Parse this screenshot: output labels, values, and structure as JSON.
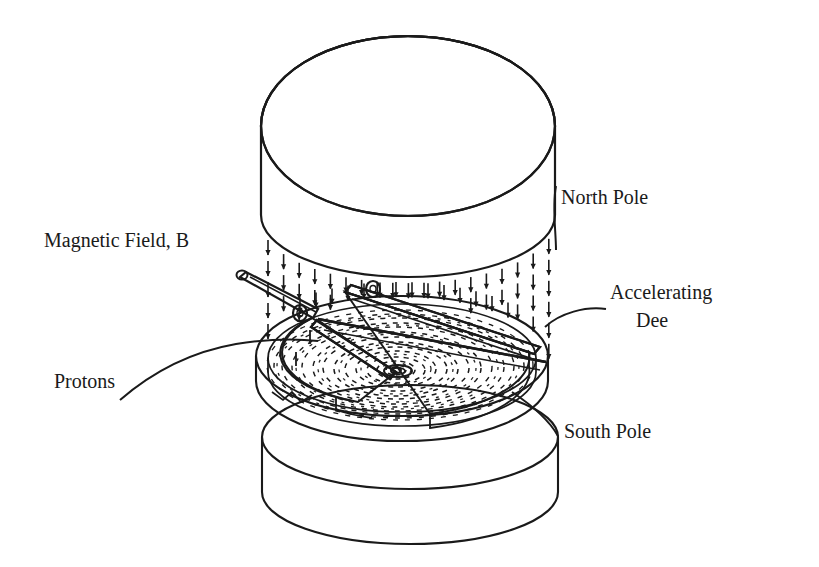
{
  "figure": {
    "kind": "technical-line-diagram",
    "background_color": "#ffffff",
    "ink_color": "#1a1a1a",
    "width": 819,
    "height": 567
  },
  "labels": {
    "north_pole": "North Pole",
    "south_pole": "South Pole",
    "magnetic_field": "Magnetic Field, B",
    "accelerating_dee_line1": "Accelerating",
    "accelerating_dee_line2": "Dee",
    "protons": "Protons"
  },
  "parts": {
    "north_pole_magnet": "North Pole",
    "south_pole_magnet": "South Pole",
    "dee_left": "Accelerating Dee",
    "dee_right": "Accelerating Dee",
    "proton_spiral": "Protons",
    "field_arrows": "Magnetic Field, B",
    "rf_stem": "RF feed stem",
    "gap_connector_lower": "insulator bushing",
    "gap_connector_upper": "insulator bushing"
  },
  "field": {
    "direction": "downward",
    "arrow_glyph": "down-arrow",
    "arrow_count": 96
  },
  "geometry": {
    "north_pole": {
      "cx": 408,
      "cy": 126,
      "rx": 147,
      "ry": 90,
      "height": 92
    },
    "south_pole": {
      "cx": 410,
      "cy": 440,
      "rx": 148,
      "ry": 52,
      "height": 96
    },
    "dee_assembly": {
      "cx": 398,
      "cy": 365,
      "rx": 140,
      "ry": 62,
      "thickness": 22
    },
    "gap_angle_deg": 38,
    "spiral": {
      "cx": 396,
      "cy": 370,
      "turns": 7,
      "ring_count": 13
    }
  }
}
